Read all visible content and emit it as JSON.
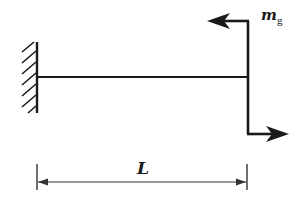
{
  "diagram": {
    "type": "cantilever-beam",
    "labels": {
      "moment_main": "m",
      "moment_sub": "g",
      "length": "L"
    },
    "colors": {
      "stroke": "#1a1a1a",
      "dimension": "#333333",
      "background": "#ffffff"
    },
    "elements": [
      {
        "name": "fixed-support",
        "x": 37,
        "y_top": 42,
        "y_bottom": 113
      },
      {
        "name": "beam",
        "x_start": 37,
        "x_end": 248,
        "y": 77
      },
      {
        "name": "applied-moment",
        "x": 248,
        "y_top": 21,
        "y_bottom": 134,
        "top_arrow_dir": "left",
        "bottom_arrow_dir": "right"
      },
      {
        "name": "length-dimension",
        "x_start": 37,
        "x_end": 247,
        "y": 182,
        "label": "L"
      }
    ]
  }
}
